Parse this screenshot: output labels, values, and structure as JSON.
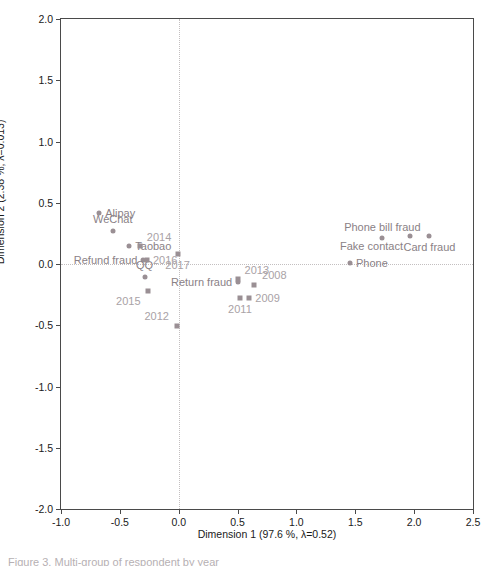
{
  "chart_data": {
    "type": "scatter",
    "title": "",
    "xlabel": "Dimension 1  (97.6 %, λ=0.52)",
    "ylabel": "Dimension 2  (2.38 %, λ=0.013)",
    "xlim": [
      -1.0,
      2.5
    ],
    "ylim": [
      -2.0,
      2.0
    ],
    "xticks": [
      "-1.0",
      "-0.5",
      "0.0",
      "0.5",
      "1.0",
      "1.5",
      "2.0",
      "2.5"
    ],
    "xtickvals": [
      -1.0,
      -0.5,
      0.0,
      0.5,
      1.0,
      1.5,
      2.0,
      2.5
    ],
    "yticks": [
      "2.0",
      "1.5",
      "1.0",
      "0.5",
      "0.0",
      "-0.5",
      "-1.0",
      "-1.5",
      "-2.0"
    ],
    "ytickvals": [
      2.0,
      1.5,
      1.0,
      0.5,
      0.0,
      -0.5,
      -1.0,
      -1.5,
      -2.0
    ],
    "grid": false,
    "reference_lines": {
      "vertical_x": 0.0,
      "horizontal_y": 0.0,
      "style": "dotted"
    },
    "legend": "none",
    "marker_color": "#9a8f94",
    "category_label_color": "#8a8186",
    "year_label_color": "#a9a2a6",
    "series": [
      {
        "name": "Categories",
        "marker": "circle",
        "points": [
          {
            "label": "Alipay",
            "x": -0.675,
            "y": 0.415,
            "label_pos": "right"
          },
          {
            "label": "WeChat",
            "x": -0.56,
            "y": 0.27,
            "label_pos": "center"
          },
          {
            "label": "Taobao",
            "x": -0.42,
            "y": 0.15,
            "label_pos": "right"
          },
          {
            "label": "Refund fraud",
            "x": -0.3,
            "y": 0.03,
            "label_pos": "left-of"
          },
          {
            "label": "QQ",
            "x": -0.29,
            "y": -0.105,
            "label_pos": "center"
          },
          {
            "label": "Return fraud",
            "x": 0.505,
            "y": -0.15,
            "label_pos": "left-of"
          },
          {
            "label": "Phone bill fraud",
            "x": 1.73,
            "y": 0.215,
            "label_pos": "above"
          },
          {
            "label": "Fake contact",
            "x": 1.965,
            "y": 0.225,
            "label_pos": "below-left"
          },
          {
            "label": "Card fraud",
            "x": 2.13,
            "y": 0.225,
            "label_pos": "below"
          },
          {
            "label": "Phone",
            "x": 1.455,
            "y": 0.01,
            "label_pos": "right"
          }
        ]
      },
      {
        "name": "Years",
        "marker": "square",
        "points": [
          {
            "label": "2008",
            "x": 0.64,
            "y": -0.17,
            "label_pos": "above-right"
          },
          {
            "label": "2009",
            "x": 0.6,
            "y": -0.275,
            "label_pos": "right"
          },
          {
            "label": "2011",
            "x": 0.52,
            "y": -0.275,
            "label_pos": "below"
          },
          {
            "label": "2012",
            "x": -0.015,
            "y": -0.505,
            "label_pos": "above-left"
          },
          {
            "label": "2013",
            "x": 0.5,
            "y": -0.12,
            "label_pos": "left-above"
          },
          {
            "label": "2014",
            "x": -0.33,
            "y": 0.15,
            "label_pos": "left-above"
          },
          {
            "label": "2015",
            "x": -0.265,
            "y": -0.22,
            "label_pos": "below-left"
          },
          {
            "label": "2016",
            "x": -0.27,
            "y": 0.03,
            "label_pos": "right"
          },
          {
            "label": "2017",
            "x": -0.01,
            "y": 0.085,
            "label_pos": "below"
          }
        ]
      }
    ]
  },
  "caption": {
    "text": "Figure 3. Multi-group of respondent by year"
  }
}
